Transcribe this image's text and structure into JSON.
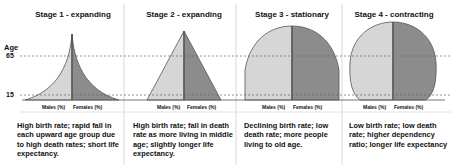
{
  "axis": {
    "label": "Age",
    "ticks": [
      "65",
      "15"
    ]
  },
  "stages": [
    {
      "title": "Stage 1 - expanding",
      "shape": "concave-pyramid",
      "males_label": "Males (%)",
      "females_label": "Females (%)",
      "description": "High birth rate; rapid fall in each upward age group due to high death rates; short life expectancy."
    },
    {
      "title": "Stage 2 - expanding",
      "shape": "pyramid",
      "males_label": "Males (%)",
      "females_label": "Females (%)",
      "description": "High birth rate; fall in death rate as more living in middle age; slightly longer life expectancy."
    },
    {
      "title": "Stage 3 - stationary",
      "shape": "dome",
      "males_label": "Males (%)",
      "females_label": "Females (%)",
      "description": "Declining birth rate; low death rate; more people living to old age."
    },
    {
      "title": "Stage 4 - contracting",
      "shape": "bulging-dome",
      "males_label": "Males (%)",
      "females_label": "Females (%)",
      "description": "Low birth rate; low death rate; higher dependency ratio; longer life expectancy"
    }
  ],
  "colors": {
    "males": "#d6d6d6",
    "females": "#8c8c8c",
    "outline": "#555555",
    "divider": "#cccccc"
  }
}
